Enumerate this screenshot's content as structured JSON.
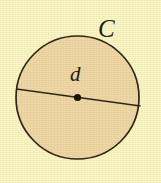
{
  "figure": {
    "kind": "circle-diameter-diagram",
    "background_color": "#FAF7C4",
    "circle": {
      "name": "circle-shape",
      "fill_color": "#EFD7A6",
      "stroke_color": "#2B2318",
      "stroke_width": 1.7,
      "center_x": 77.5,
      "center_y": 97.5,
      "radius": 61.5
    },
    "center_point": {
      "name": "center-dot",
      "color": "#15110B",
      "x": 77.5,
      "y": 97.5,
      "radius": 3.6
    },
    "diameter_line": {
      "name": "diameter-line",
      "color": "#2B2318",
      "stroke_width": 1.6,
      "x1": 16.5,
      "y1": 89.0,
      "x2": 140.5,
      "y2": 106.0
    },
    "labels": {
      "circumference": "C",
      "diameter": "d"
    }
  }
}
